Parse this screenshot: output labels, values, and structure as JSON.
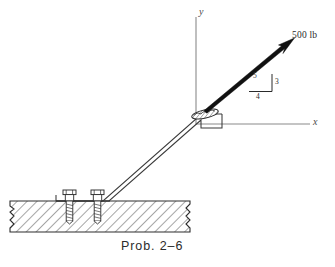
{
  "figure": {
    "caption": "Prob. 2–6",
    "axes": {
      "y_label": "y",
      "x_label": "x"
    },
    "force": {
      "magnitude_label": "500 lb",
      "slope_hypotenuse": "5",
      "slope_vertical": "3",
      "slope_horizontal": "4"
    },
    "colors": {
      "line": "#3a3a3a",
      "arrow": "#111111",
      "axis": "#6a6a6a",
      "hatch": "#3a3a3a",
      "text": "#2a2a2a",
      "background": "#ffffff"
    }
  }
}
